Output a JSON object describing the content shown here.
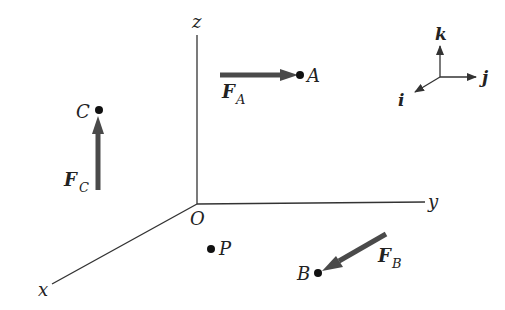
{
  "diagram": {
    "axes": {
      "x_label": "x",
      "y_label": "y",
      "z_label": "z",
      "origin_label": "O"
    },
    "points": [
      {
        "id": "A",
        "label": "A"
      },
      {
        "id": "B",
        "label": "B"
      },
      {
        "id": "C",
        "label": "C"
      },
      {
        "id": "P",
        "label": "P"
      }
    ],
    "forces": [
      {
        "id": "FA",
        "symbol": "F",
        "subscript": "A",
        "direction": "+j (pointing toward A)"
      },
      {
        "id": "FB",
        "symbol": "F",
        "subscript": "B",
        "direction": "+i (pointing toward B)"
      },
      {
        "id": "FC",
        "symbol": "F",
        "subscript": "C",
        "direction": "+k (pointing toward C)"
      }
    ],
    "unit_vectors": {
      "i": "i",
      "j": "j",
      "k": "k"
    },
    "colors": {
      "line": "#333333",
      "arrow": "#4a4a4a",
      "text": "#222222"
    }
  }
}
